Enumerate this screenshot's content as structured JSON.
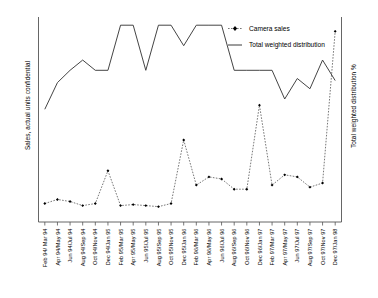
{
  "chart_data": {
    "type": "line",
    "title": "",
    "xlabel": "",
    "ylabel": "Sales, actual units confidential",
    "y2label": "Total weighted distribution %",
    "grid": false,
    "legend_position": "top-right",
    "categories": [
      "Feb 94/ Mar 94",
      "Apr 94/May 94",
      "Jun 94/Jul 94",
      "Aug 94/Sep 94",
      "Oct 94/Nov 94",
      "Dec 94/Jan 95",
      "Feb 95/Mar 95",
      "Apr 95/May 95",
      "Jun 95/Jul 95",
      "Aug 95/Sep 95",
      "Oct 95/Nov 95",
      "Dec 95/Jan 96",
      "Feb 96/Mar 96",
      "Apr 96/May 96",
      "Jun 96/Jul 96",
      "Aug 96/Sep 96",
      "Oct 96/Nov 96",
      "Dec 96/Jan 97",
      "Feb 97/Mar 97",
      "Apr 97/May 97",
      "Jun 97/Jul 97",
      "Aug 97/Sep 97",
      "Oct 97/Nov 97",
      "Dec 97/Jan 98"
    ],
    "series": [
      {
        "name": "Camera sales",
        "axis": "left",
        "style": "dashed",
        "marker": "diamond",
        "color": "#000000",
        "values": [
          9,
          11,
          10,
          8,
          9,
          25,
          8,
          8.5,
          8,
          7.5,
          9,
          40,
          18,
          22,
          21,
          16,
          16,
          57,
          18,
          23,
          22,
          17,
          19,
          93
        ],
        "ylim": [
          0,
          100
        ]
      },
      {
        "name": "Total weighted distribution",
        "axis": "right",
        "style": "solid",
        "color": "#3a3a3a",
        "values": [
          55,
          68,
          74,
          79,
          74,
          74,
          96,
          96,
          74,
          96,
          96,
          86,
          96,
          96,
          96,
          74,
          74,
          74,
          74,
          60,
          70,
          65,
          79,
          69
        ],
        "ylim": [
          0,
          100
        ]
      }
    ]
  },
  "legend": {
    "items": [
      {
        "label": "Camera sales",
        "marker": "dashed-diamond"
      },
      {
        "label": "Total weighted distribution",
        "marker": "solid-line"
      }
    ]
  },
  "axes": {
    "left_title": "Sales, actual units confidential",
    "right_title": "Total weighted distribution %"
  }
}
